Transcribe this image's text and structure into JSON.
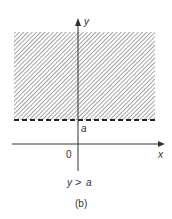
{
  "diagram": {
    "axes": {
      "x_label": "x",
      "y_label": "y",
      "origin_label": "0"
    },
    "boundary": {
      "label": "a",
      "style": "dashed"
    },
    "region": {
      "description": "shaded half-plane above the dashed line",
      "fill": "hatched"
    },
    "inequality": {
      "lhs": "y",
      "op": ">",
      "rhs": "a"
    },
    "caption": "(b)",
    "colors": {
      "ink": "#333333",
      "hatch": "#555555",
      "background": "#ffffff"
    }
  }
}
